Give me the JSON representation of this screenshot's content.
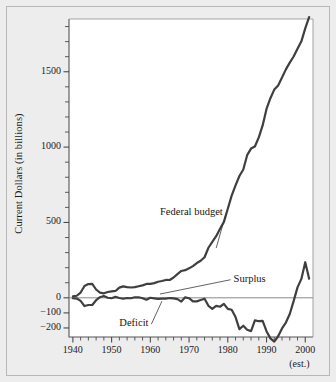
{
  "figure": {
    "background_color": "#eeeded",
    "plot_background_color": "#ffffff",
    "border_color": "#b8b7b6",
    "line_color": "#3f3f3f",
    "zero_line_color": "#8a8a8a",
    "text_color": "#1b1b1b"
  },
  "chart_data": {
    "type": "line",
    "title": "",
    "subtitle": "",
    "xlabel": "",
    "ylabel": "Current Dollars (in billions)",
    "xlim": [
      1939,
      2002
    ],
    "ylim": [
      -260,
      1850
    ],
    "grid": false,
    "legend": "none",
    "x_ticks": [
      1940,
      1950,
      1960,
      1970,
      1980,
      1990,
      2000
    ],
    "x_tick_labels": [
      "1940",
      "1950",
      "1960",
      "1970",
      "1980",
      "1990",
      "2000"
    ],
    "x_minor_tick_step": 2,
    "y_ticks": [
      -200,
      -100,
      0,
      500,
      1000,
      1500
    ],
    "y_tick_labels": [
      "−200",
      "−100",
      "0",
      "500",
      "1000",
      "1500"
    ],
    "y_minor_tick_step": 100,
    "x_axis_note": "(est.)",
    "annotations": [
      {
        "text": "Federal budget",
        "x": 1962.5,
        "y": 560,
        "leader_to_x": 1977.0,
        "leader_to_y": 330
      },
      {
        "text": "Surplus",
        "x": 1981.5,
        "y": 120,
        "leader_to_x": 1962.5,
        "leader_to_y": 25
      },
      {
        "text": "Deficit",
        "x": 1952.0,
        "y": -175,
        "leader_to_x": 1963.0,
        "leader_to_y": -22
      }
    ],
    "series": [
      {
        "name": "Federal budget",
        "x": [
          1940,
          1941,
          1942,
          1943,
          1944,
          1945,
          1946,
          1947,
          1948,
          1949,
          1950,
          1951,
          1952,
          1953,
          1954,
          1955,
          1956,
          1957,
          1958,
          1959,
          1960,
          1961,
          1962,
          1963,
          1964,
          1965,
          1966,
          1967,
          1968,
          1969,
          1970,
          1971,
          1972,
          1973,
          1974,
          1975,
          1976,
          1977,
          1978,
          1979,
          1980,
          1981,
          1982,
          1983,
          1984,
          1985,
          1986,
          1987,
          1988,
          1989,
          1990,
          1991,
          1992,
          1993,
          1994,
          1995,
          1996,
          1997,
          1998,
          1999,
          2000,
          2001
        ],
        "values": [
          9.5,
          13.7,
          35.1,
          78.6,
          91.3,
          92.7,
          55.2,
          34.5,
          29.8,
          38.8,
          42.6,
          45.5,
          67.7,
          76.1,
          70.9,
          68.4,
          70.6,
          76.6,
          82.4,
          92.1,
          92.2,
          97.7,
          106.8,
          111.3,
          118.5,
          118.2,
          134.5,
          157.5,
          178.1,
          183.6,
          195.6,
          210.2,
          230.7,
          245.7,
          269.4,
          332.3,
          371.8,
          409.2,
          458.7,
          504.0,
          590.9,
          678.2,
          745.7,
          808.4,
          851.8,
          946.4,
          990.3,
          1004.0,
          1064.4,
          1143.7,
          1253.2,
          1324.4,
          1381.5,
          1409.4,
          1461.7,
          1515.7,
          1560.5,
          1601.1,
          1652.5,
          1701.8,
          1788.0,
          1863.0
        ]
      },
      {
        "name": "Surplus / Deficit",
        "x": [
          1940,
          1941,
          1942,
          1943,
          1944,
          1945,
          1946,
          1947,
          1948,
          1949,
          1950,
          1951,
          1952,
          1953,
          1954,
          1955,
          1956,
          1957,
          1958,
          1959,
          1960,
          1961,
          1962,
          1963,
          1964,
          1965,
          1966,
          1967,
          1968,
          1969,
          1970,
          1971,
          1972,
          1973,
          1974,
          1975,
          1976,
          1977,
          1978,
          1979,
          1980,
          1981,
          1982,
          1983,
          1984,
          1985,
          1986,
          1987,
          1988,
          1989,
          1990,
          1991,
          1992,
          1993,
          1994,
          1995,
          1996,
          1997,
          1998,
          1999,
          2000,
          2001
        ],
        "values": [
          -2.9,
          -4.9,
          -20.5,
          -54.6,
          -47.6,
          -47.6,
          -15.9,
          4.0,
          11.8,
          0.6,
          -3.1,
          6.1,
          -1.5,
          -6.5,
          -1.2,
          -3.0,
          3.9,
          3.4,
          -2.8,
          -12.8,
          0.3,
          -3.3,
          -7.1,
          -4.8,
          -5.9,
          -1.4,
          -3.7,
          -8.6,
          -25.2,
          3.2,
          -2.8,
          -23.0,
          -23.4,
          -14.9,
          -6.1,
          -53.2,
          -73.7,
          -53.7,
          -59.2,
          -40.7,
          -73.8,
          -79.0,
          -128.0,
          -207.8,
          -185.4,
          -212.3,
          -221.2,
          -149.7,
          -155.2,
          -152.6,
          -221.2,
          -269.2,
          -290.3,
          -255.1,
          -203.2,
          -164.0,
          -107.4,
          -21.9,
          69.3,
          125.6,
          236.2,
          127.0
        ]
      }
    ]
  },
  "axis_titles": {
    "y": "Current Dollars (in billions)"
  }
}
